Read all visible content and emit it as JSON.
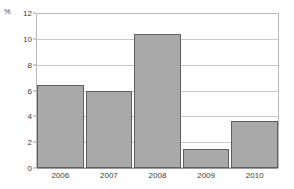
{
  "chart_data": {
    "type": "bar",
    "title": "",
    "subtitle": "",
    "xlabel": "",
    "ylabel": "%",
    "unit_label": "%",
    "categories": [
      "2006",
      "2007",
      "2008",
      "2009",
      "2010"
    ],
    "values": [
      6.45,
      5.95,
      10.4,
      1.45,
      3.65
    ],
    "ylim": [
      0,
      12
    ],
    "yticks": [
      0,
      2,
      4,
      6,
      8,
      10,
      12
    ],
    "ytick_labels": [
      "0",
      "2",
      "4",
      "6",
      "8",
      "10",
      "12"
    ],
    "grid": true,
    "grid_axis": "y",
    "legend": null,
    "legend_position": "none",
    "series": [
      {
        "name": "",
        "values": [
          6.45,
          5.95,
          10.4,
          1.45,
          3.65
        ]
      }
    ],
    "colors": {
      "bar_fill": "#a9a9a9",
      "bar_border": "#5f5f5f",
      "gridline": "#c9c9c9",
      "frame": "#b9b9b9",
      "axis": "#9a9a9a",
      "text": "#3c3c3c",
      "background": "#ffffff"
    }
  }
}
